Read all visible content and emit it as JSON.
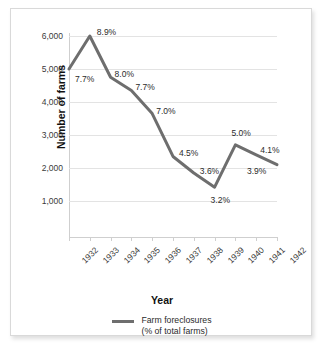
{
  "chart_data": {
    "type": "line",
    "title": "",
    "xlabel": "Year",
    "ylabel": "Number of farms",
    "categories": [
      "1932",
      "1933",
      "1934",
      "1935",
      "1936",
      "1937",
      "1938",
      "1939",
      "1940",
      "1941",
      "1942"
    ],
    "values": [
      5000,
      6000,
      4750,
      4350,
      3650,
      2350,
      1850,
      1420,
      2700,
      2400,
      2100
    ],
    "point_labels": [
      "7.7%",
      "8.9%",
      "8.0%",
      "7.7%",
      "7.0%",
      "4.5%",
      "3.6%",
      "3.2%",
      "5.0%",
      "4.1%",
      "3.9%"
    ],
    "ylim": [
      0,
      6000
    ],
    "ytick_labels": [
      "6,000",
      "5,000",
      "4,000",
      "3,000",
      "2,000",
      "1,000"
    ],
    "ytick_values": [
      6000,
      5000,
      4000,
      3000,
      2000,
      1000
    ],
    "grid": true,
    "legend_position": "bottom",
    "series": [
      {
        "name": "Farm foreclosures (% of total farms)",
        "color": "#6e6e6e",
        "values": [
          5000,
          6000,
          4750,
          4350,
          3650,
          2350,
          1850,
          1420,
          2700,
          2400,
          2100
        ]
      }
    ],
    "legend": {
      "line1": "Farm foreclosures",
      "line2": "(% of total farms)"
    },
    "colors": {
      "line": "#6e6e6e",
      "grid": "#e3e3e3",
      "axis": "#cfcfcf",
      "text": "#2b2b2b",
      "background": "#ffffff",
      "border": "#d9d9d9"
    }
  }
}
